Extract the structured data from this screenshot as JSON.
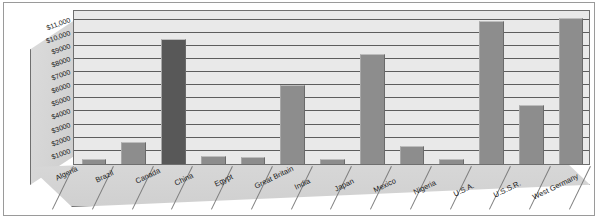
{
  "chart_data": {
    "type": "bar",
    "title": "",
    "subtitle": "",
    "xlabel": "",
    "ylabel": "",
    "grid": true,
    "legend": "none",
    "projection": "3d-perspective",
    "ylim": [
      0,
      11800
    ],
    "categories": [
      "Algeria",
      "Brazil",
      "Canada",
      "China",
      "Egypt",
      "Great Britain",
      "India",
      "Japan",
      "Mexico",
      "Nigeria",
      "U.S.A.",
      "U.S.S.R.",
      "West Germany"
    ],
    "values": [
      400,
      1700,
      9500,
      600,
      500,
      6000,
      400,
      8400,
      1400,
      350,
      10900,
      4500,
      11100
    ],
    "yticks": [
      "$1000",
      "$2000",
      "$3000",
      "$4000",
      "$5000",
      "$6000",
      "$7000",
      "$8000",
      "$9000",
      "$10,000",
      "$11,000"
    ],
    "ytick_values": [
      1000,
      2000,
      3000,
      4000,
      5000,
      6000,
      7000,
      8000,
      9000,
      10000,
      11000
    ],
    "bar_colors": [
      "#8d8d8d",
      "#8d8d8d",
      "#585858",
      "#8d8d8d",
      "#8d8d8d",
      "#8d8d8d",
      "#8d8d8d",
      "#8d8d8d",
      "#8d8d8d",
      "#8d8d8d",
      "#8d8d8d",
      "#8d8d8d",
      "#8d8d8d"
    ],
    "colors": {
      "plot_background": "#e9e9e9",
      "wall_fill": "#d6d6d6",
      "floor_fill": "#d5d5d5",
      "gridline": "#5d5d5d",
      "outline": "#6f6f6f",
      "frame": "#9a9a9a",
      "text": "#1a1a1a",
      "bar_default": "#8d8d8d",
      "bar_highlight": "#585858"
    }
  }
}
